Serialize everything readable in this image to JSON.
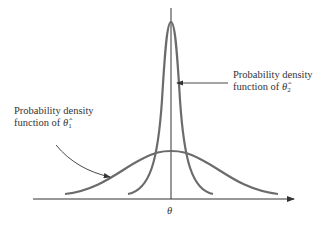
{
  "diagram": {
    "axis_label": "θ",
    "curve_color": "#6b6b6b",
    "axis_color": "#333333",
    "labels": {
      "theta2": {
        "line1": "Probability density",
        "line2_prefix": "function of",
        "symbol": "θ̂",
        "subscript": "2"
      },
      "theta1": {
        "line1": "Probability density",
        "line2_prefix": "function of",
        "symbol": "θ̂",
        "subscript": "1"
      }
    }
  }
}
